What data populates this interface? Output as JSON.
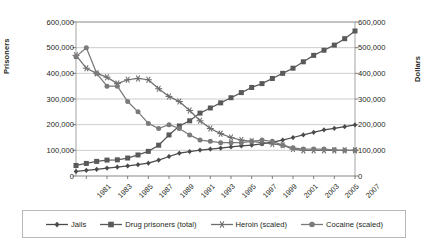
{
  "chart_data": {
    "type": "line",
    "title": "",
    "xlabel": "",
    "ylabel": "Prisoners",
    "y2label": "Dollars",
    "ylim": [
      0,
      600000
    ],
    "y2lim": [
      0,
      600000
    ],
    "grid": true,
    "legend_position": "bottom",
    "y_ticks": [
      "0",
      "100,000",
      "200,000",
      "300,000",
      "400,000",
      "500,000",
      "600,000"
    ],
    "y2_ticks": [
      "0",
      "100,000",
      "200,000",
      "300,000",
      "400,000",
      "500,000",
      "600,000"
    ],
    "x": [
      1980,
      1981,
      1982,
      1983,
      1984,
      1985,
      1986,
      1987,
      1988,
      1989,
      1990,
      1991,
      1992,
      1993,
      1994,
      1995,
      1996,
      1997,
      1998,
      1999,
      2000,
      2001,
      2002,
      2003,
      2004,
      2005,
      2006,
      2007
    ],
    "x_tick_labels": [
      "1981",
      "1983",
      "1985",
      "1987",
      "1989",
      "1991",
      "1993",
      "1995",
      "1997",
      "1999",
      "2001",
      "2003",
      "2005",
      "2007"
    ],
    "x_tick_values": [
      1981,
      1983,
      1985,
      1987,
      1989,
      1991,
      1993,
      1995,
      1997,
      1999,
      2001,
      2003,
      2005,
      2007
    ],
    "series": [
      {
        "name": "Jails",
        "marker": "diamond",
        "axis": "left",
        "color": "#4a4a4a",
        "values": [
          18000,
          22000,
          26000,
          31000,
          35000,
          39000,
          44000,
          50000,
          62000,
          76000,
          89000,
          95000,
          101000,
          105000,
          109000,
          113000,
          117000,
          120000,
          125000,
          132000,
          140000,
          150000,
          160000,
          170000,
          180000,
          186000,
          192000,
          199000
        ]
      },
      {
        "name": "Drug prisoners (total)",
        "marker": "square",
        "axis": "left",
        "color": "#595959",
        "values": [
          41000,
          49000,
          57000,
          62000,
          63000,
          70000,
          82000,
          96000,
          120000,
          160000,
          195000,
          215000,
          245000,
          265000,
          285000,
          305000,
          325000,
          345000,
          360000,
          380000,
          400000,
          420000,
          445000,
          470000,
          490000,
          510000,
          535000,
          565000
        ]
      },
      {
        "name": "Heroin (scaled)",
        "marker": "star",
        "axis": "right",
        "color": "#6e6e6e",
        "values": [
          470000,
          420000,
          400000,
          385000,
          360000,
          375000,
          380000,
          375000,
          340000,
          310000,
          290000,
          255000,
          215000,
          185000,
          165000,
          150000,
          140000,
          135000,
          130000,
          125000,
          120000,
          105000,
          100000,
          100000,
          100000,
          100000,
          100000,
          100000
        ]
      },
      {
        "name": "Cocaine (scaled)",
        "marker": "circle",
        "axis": "right",
        "color": "#7a7a7a",
        "values": [
          465000,
          500000,
          400000,
          350000,
          350000,
          290000,
          250000,
          205000,
          185000,
          200000,
          185000,
          160000,
          140000,
          135000,
          130000,
          130000,
          130000,
          135000,
          140000,
          135000,
          120000,
          110000,
          105000,
          105000,
          105000,
          102000,
          100000,
          100000
        ]
      }
    ]
  },
  "legend": {
    "items": [
      {
        "label": "Jails"
      },
      {
        "label": "Drug prisoners (total)"
      },
      {
        "label": "Heroin (scaled)"
      },
      {
        "label": "Cocaine (scaled)"
      }
    ]
  }
}
